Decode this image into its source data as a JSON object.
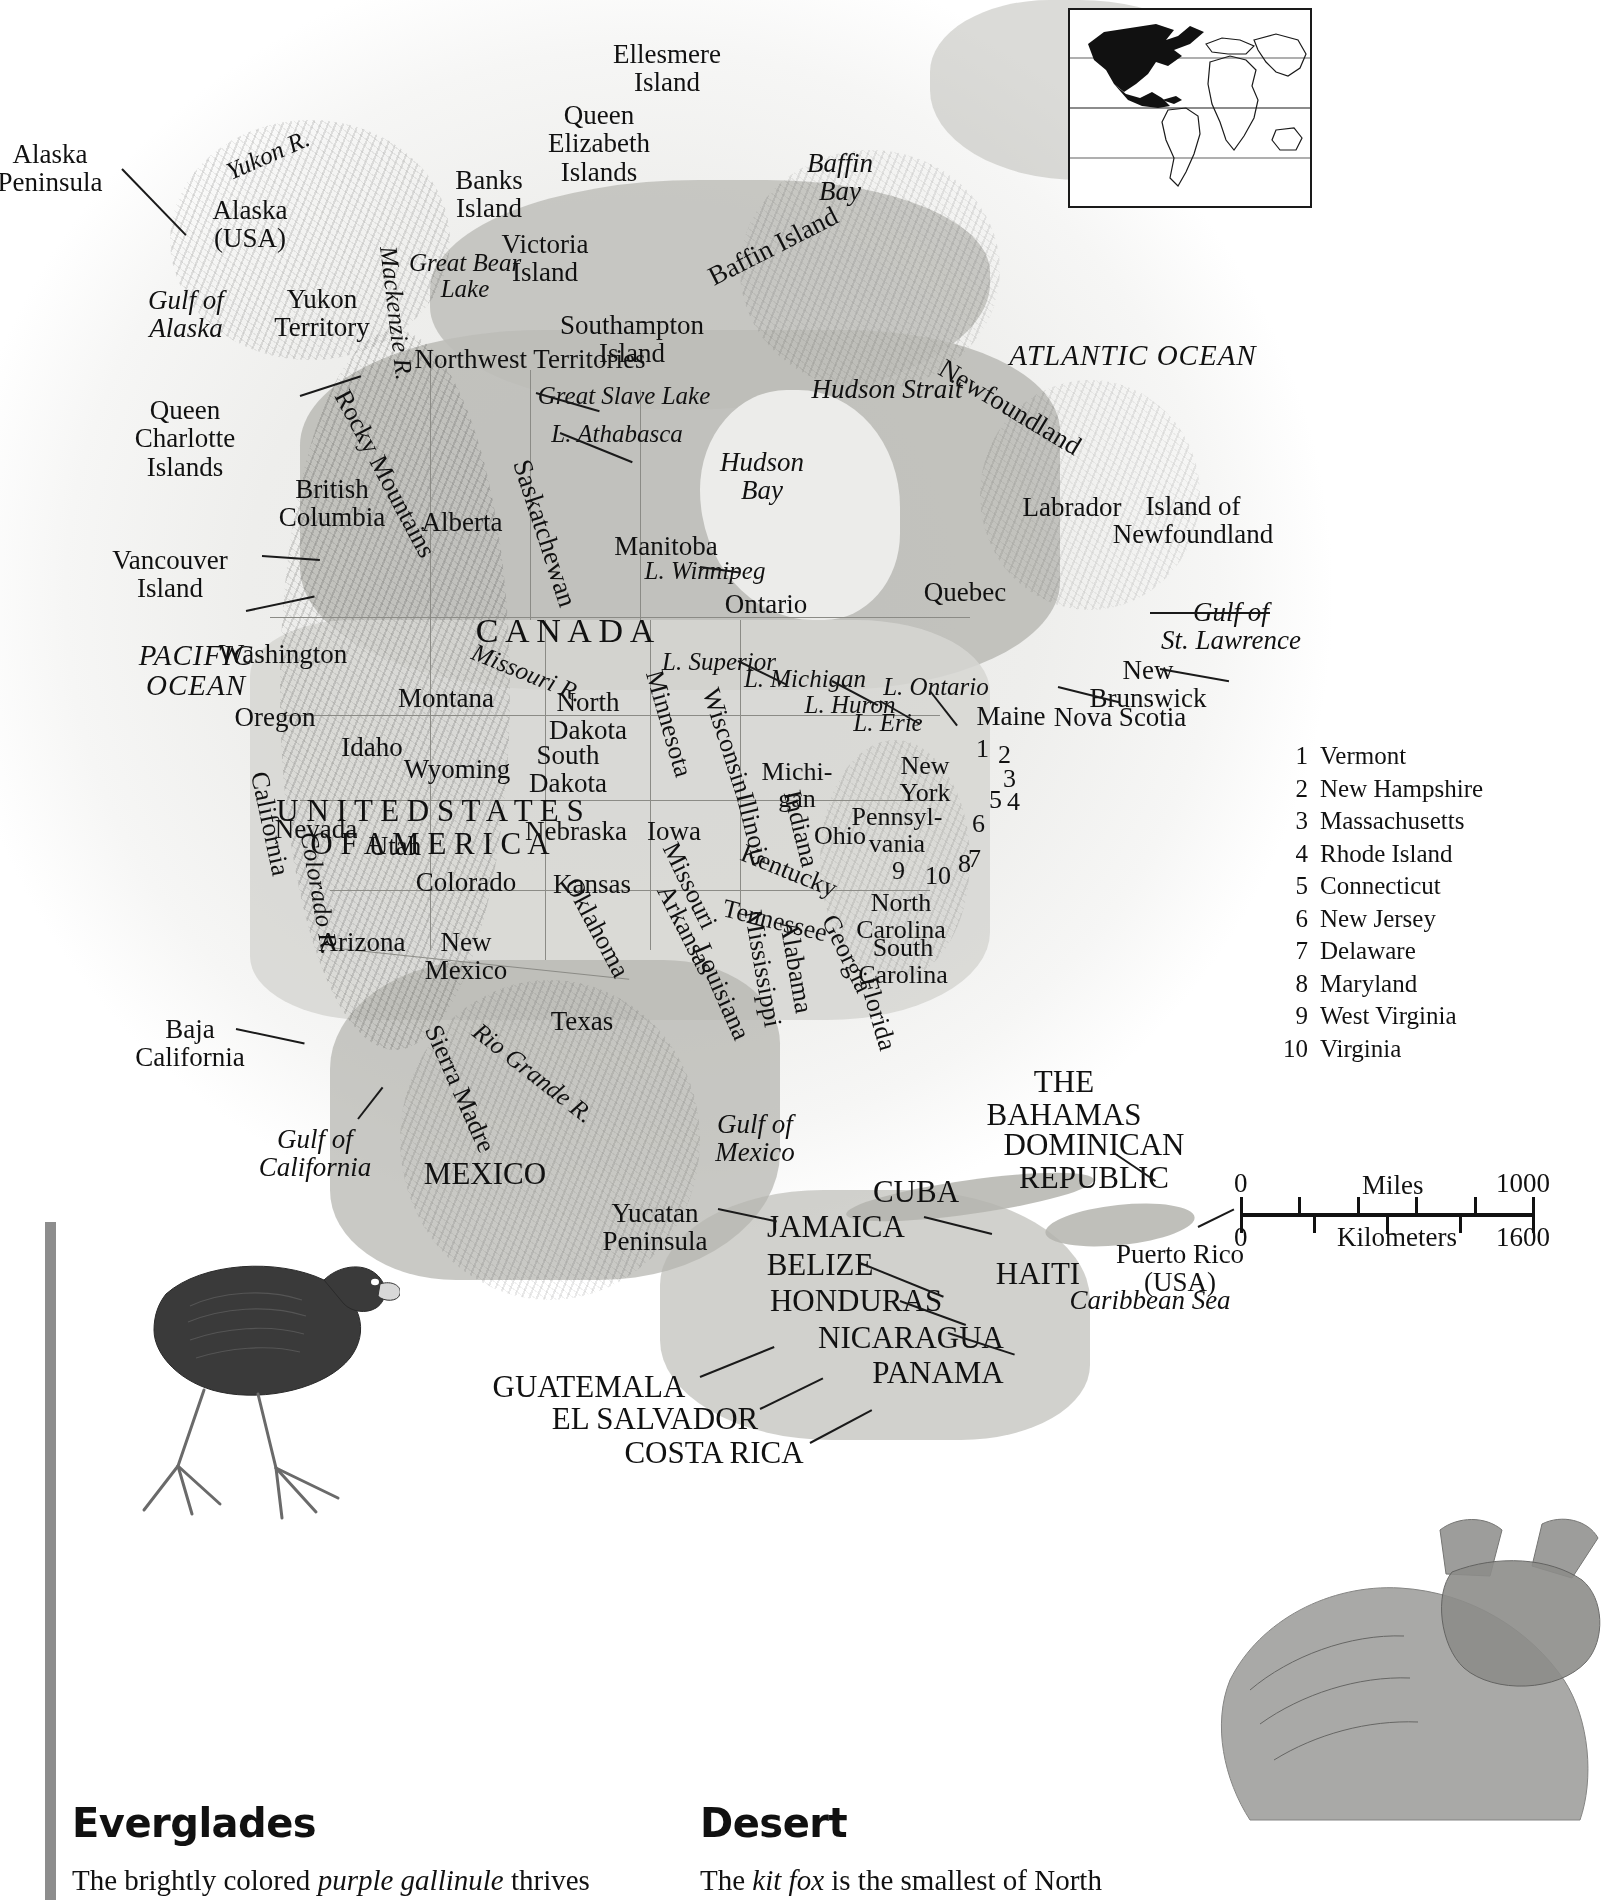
{
  "page": {
    "width": 1620,
    "height": 1900,
    "ink": "#1a1a1a",
    "land_tone": "#c8c8c4",
    "sea_tone": "#e7e7e5"
  },
  "inset": {
    "name": "world-locator-inset",
    "highlight_region": "North America",
    "highlight_color": "#111111",
    "background": "#ffffff"
  },
  "map": {
    "oceans": [
      {
        "text": "PACIFIC\nOCEAN",
        "line1": "PACIFIC",
        "line2": "OCEAN"
      },
      {
        "text": "ATLANTIC OCEAN",
        "line1": "ATLANTIC OCEAN",
        "line2": ""
      }
    ],
    "labels_ocean": [
      {
        "id": "pacific-ocean",
        "line1": "PACIFIC",
        "line2": "OCEAN",
        "x": 196,
        "y": 646,
        "size": 29
      },
      {
        "id": "atlantic-ocean",
        "line1": "ATLANTIC OCEAN",
        "line2": "",
        "x": 1133,
        "y": 343,
        "size": 29
      }
    ],
    "labels_water": [
      {
        "id": "gulf-of-alaska",
        "line1": "Gulf of",
        "line2": "Alaska",
        "x": 186,
        "y": 286,
        "size": 27
      },
      {
        "id": "baffin-bay",
        "line1": "Baffin",
        "line2": "Bay",
        "x": 840,
        "y": 149,
        "size": 27
      },
      {
        "id": "hudson-bay",
        "line1": "Hudson",
        "line2": "Bay",
        "x": 762,
        "y": 448,
        "size": 27
      },
      {
        "id": "hudson-strait",
        "line1": "Hudson Strait",
        "line2": "",
        "x": 887,
        "y": 375,
        "size": 27
      },
      {
        "id": "great-bear-lake",
        "line1": "Great Bear",
        "line2": "Lake",
        "x": 465,
        "y": 250,
        "size": 25
      },
      {
        "id": "great-slave-lake",
        "line1": "Great Slave Lake",
        "line2": "",
        "x": 624,
        "y": 383,
        "size": 25
      },
      {
        "id": "lake-athabasca",
        "line1": "L. Athabasca",
        "line2": "",
        "x": 617,
        "y": 421,
        "size": 25
      },
      {
        "id": "lake-winnipeg",
        "line1": "L. Winnipeg",
        "line2": "",
        "x": 705,
        "y": 558,
        "size": 25
      },
      {
        "id": "lake-superior",
        "line1": "L. Superior",
        "line2": "",
        "x": 719,
        "y": 649,
        "size": 25
      },
      {
        "id": "lake-michigan",
        "line1": "L. Michigan",
        "line2": "",
        "x": 805,
        "y": 666,
        "size": 25
      },
      {
        "id": "lake-huron",
        "line1": "L. Huron",
        "line2": "",
        "x": 850,
        "y": 692,
        "size": 25
      },
      {
        "id": "lake-erie",
        "line1": "L. Erie",
        "line2": "",
        "x": 888,
        "y": 710,
        "size": 25
      },
      {
        "id": "lake-ontario",
        "line1": "L. Ontario",
        "line2": "",
        "x": 936,
        "y": 674,
        "size": 25
      },
      {
        "id": "gulf-of-st-lawrence",
        "line1": "Gulf of",
        "line2": "St. Lawrence",
        "x": 1231,
        "y": 598,
        "size": 27
      },
      {
        "id": "gulf-of-mexico",
        "line1": "Gulf of",
        "line2": "Mexico",
        "x": 755,
        "y": 1110,
        "size": 27
      },
      {
        "id": "gulf-of-california",
        "line1": "Gulf of",
        "line2": "California",
        "x": 315,
        "y": 1125,
        "size": 27
      },
      {
        "id": "caribbean-sea",
        "line1": "Caribbean Sea",
        "line2": "",
        "x": 1150,
        "y": 1286,
        "size": 27
      },
      {
        "id": "yukon-river",
        "line1": "Yukon R.",
        "line2": "",
        "x": 268,
        "y": 142,
        "size": 25,
        "rot": -24
      },
      {
        "id": "mackenzie-river",
        "line1": "Mackenzie R.",
        "line2": "",
        "x": 396,
        "y": 300,
        "size": 25,
        "rot": 83
      },
      {
        "id": "missouri-river",
        "line1": "Missouri R.",
        "line2": "",
        "x": 527,
        "y": 660,
        "size": 25,
        "rot": 22
      },
      {
        "id": "colorado-river",
        "line1": "Colorado R.",
        "line2": "",
        "x": 319,
        "y": 880,
        "size": 25,
        "rot": 80
      },
      {
        "id": "rio-grande-river",
        "line1": "Rio Grande R.",
        "line2": "",
        "x": 533,
        "y": 1060,
        "size": 25,
        "rot": 38
      }
    ],
    "labels_land": [
      {
        "id": "alaska-peninsula",
        "line1": "Alaska",
        "line2": "Peninsula",
        "x": 50,
        "y": 140,
        "size": 27
      },
      {
        "id": "alaska-usa",
        "line1": "Alaska",
        "line2": "(USA)",
        "x": 250,
        "y": 196,
        "size": 27
      },
      {
        "id": "yukon-territory",
        "line1": "Yukon",
        "line2": "Territory",
        "x": 322,
        "y": 285,
        "size": 27
      },
      {
        "id": "northwest-territories",
        "line1": "Northwest Territories",
        "line2": "",
        "x": 530,
        "y": 345,
        "size": 27
      },
      {
        "id": "british-columbia",
        "line1": "British",
        "line2": "Columbia",
        "x": 332,
        "y": 475,
        "size": 27
      },
      {
        "id": "alberta",
        "line1": "Alberta",
        "line2": "",
        "x": 462,
        "y": 508,
        "size": 27
      },
      {
        "id": "saskatchewan",
        "line1": "Saskatchewan",
        "line2": "",
        "x": 545,
        "y": 519,
        "size": 27,
        "rot": 72
      },
      {
        "id": "manitoba",
        "line1": "Manitoba",
        "line2": "",
        "x": 666,
        "y": 532,
        "size": 27
      },
      {
        "id": "ontario",
        "line1": "Ontario",
        "line2": "",
        "x": 766,
        "y": 590,
        "size": 27
      },
      {
        "id": "quebec",
        "line1": "Quebec",
        "line2": "",
        "x": 965,
        "y": 578,
        "size": 27
      },
      {
        "id": "labrador",
        "line1": "Labrador",
        "line2": "",
        "x": 1072,
        "y": 493,
        "size": 27
      },
      {
        "id": "canada",
        "line1": "C A N A D A",
        "line2": "",
        "x": 565,
        "y": 613,
        "size": 34
      },
      {
        "id": "queen-charlotte-islands",
        "line1": "Queen",
        "line2": "Charlotte",
        "line3": "Islands",
        "x": 185,
        "y": 396,
        "size": 27
      },
      {
        "id": "vancouver-island",
        "line1": "Vancouver",
        "line2": "Island",
        "x": 170,
        "y": 546,
        "size": 27
      },
      {
        "id": "banks-island",
        "line1": "Banks",
        "line2": "Island",
        "x": 489,
        "y": 166,
        "size": 27
      },
      {
        "id": "victoria-island",
        "line1": "Victoria",
        "line2": "Island",
        "x": 545,
        "y": 230,
        "size": 27
      },
      {
        "id": "queen-elizabeth-islands",
        "line1": "Queen",
        "line2": "Elizabeth",
        "line3": "Islands",
        "x": 599,
        "y": 101,
        "size": 27
      },
      {
        "id": "ellesmere-island",
        "line1": "Ellesmere",
        "line2": "Island",
        "x": 667,
        "y": 40,
        "size": 27
      },
      {
        "id": "southampton-island",
        "line1": "Southampton",
        "line2": "Island",
        "x": 632,
        "y": 311,
        "size": 27
      },
      {
        "id": "baffin-island",
        "line1": "Baffin Island",
        "line2": "",
        "x": 773,
        "y": 232,
        "size": 27,
        "rot": -27
      },
      {
        "id": "newfoundland-region",
        "line1": "Newfoundland",
        "line2": "",
        "x": 1010,
        "y": 393,
        "size": 27,
        "rot": 31
      },
      {
        "id": "island-of-newfoundland",
        "line1": "Island of",
        "line2": "Newfoundland",
        "x": 1193,
        "y": 492,
        "size": 27
      },
      {
        "id": "new-brunswick",
        "line1": "New",
        "line2": "Brunswick",
        "x": 1148,
        "y": 656,
        "size": 27
      },
      {
        "id": "nova-scotia",
        "line1": "Nova Scotia",
        "line2": "",
        "x": 1120,
        "y": 703,
        "size": 27
      },
      {
        "id": "maine",
        "line1": "Maine",
        "line2": "",
        "x": 1011,
        "y": 702,
        "size": 27
      },
      {
        "id": "washington",
        "line1": "Washington",
        "line2": "",
        "x": 283,
        "y": 640,
        "size": 27
      },
      {
        "id": "oregon",
        "line1": "Oregon",
        "line2": "",
        "x": 275,
        "y": 703,
        "size": 27
      },
      {
        "id": "idaho",
        "line1": "Idaho",
        "line2": "",
        "x": 372,
        "y": 733,
        "size": 27
      },
      {
        "id": "montana",
        "line1": "Montana",
        "line2": "",
        "x": 446,
        "y": 684,
        "size": 27
      },
      {
        "id": "wyoming",
        "line1": "Wyoming",
        "line2": "",
        "x": 457,
        "y": 755,
        "size": 27
      },
      {
        "id": "north-dakota",
        "line1": "North",
        "line2": "Dakota",
        "x": 588,
        "y": 688,
        "size": 27
      },
      {
        "id": "south-dakota",
        "line1": "South",
        "line2": "Dakota",
        "x": 568,
        "y": 741,
        "size": 27
      },
      {
        "id": "nebraska",
        "line1": "Nebraska",
        "line2": "",
        "x": 576,
        "y": 817,
        "size": 27
      },
      {
        "id": "iowa",
        "line1": "Iowa",
        "line2": "",
        "x": 674,
        "y": 817,
        "size": 27
      },
      {
        "id": "minnesota",
        "line1": "Minnesota",
        "line2": "",
        "x": 669,
        "y": 710,
        "size": 26,
        "rot": 74
      },
      {
        "id": "wisconsin",
        "line1": "Wisconsin",
        "line2": "",
        "x": 727,
        "y": 727,
        "size": 26,
        "rot": 72
      },
      {
        "id": "michigan",
        "line1": "Michi-",
        "line2": "gan",
        "x": 797,
        "y": 758,
        "size": 26
      },
      {
        "id": "illinois",
        "line1": "Illinois",
        "line2": "",
        "x": 753,
        "y": 815,
        "size": 26,
        "rot": 76
      },
      {
        "id": "indiana",
        "line1": "Indiana",
        "line2": "",
        "x": 801,
        "y": 815,
        "size": 26,
        "rot": 76
      },
      {
        "id": "ohio",
        "line1": "Ohio",
        "line2": "",
        "x": 840,
        "y": 822,
        "size": 26
      },
      {
        "id": "pennsylvania",
        "line1": "Pennsyl-",
        "line2": "vania",
        "x": 897,
        "y": 803,
        "size": 26
      },
      {
        "id": "new-york",
        "line1": "New",
        "line2": "York",
        "x": 925,
        "y": 752,
        "size": 26
      },
      {
        "id": "nevada",
        "line1": "Nevada",
        "line2": "",
        "x": 316,
        "y": 815,
        "size": 27
      },
      {
        "id": "utah",
        "line1": "Utah",
        "line2": "",
        "x": 395,
        "y": 832,
        "size": 27
      },
      {
        "id": "california",
        "line1": "California",
        "line2": "",
        "x": 270,
        "y": 810,
        "size": 26,
        "rot": 78
      },
      {
        "id": "colorado",
        "line1": "Colorado",
        "line2": "",
        "x": 466,
        "y": 868,
        "size": 27
      },
      {
        "id": "kansas",
        "line1": "Kansas",
        "line2": "",
        "x": 592,
        "y": 870,
        "size": 27
      },
      {
        "id": "missouri",
        "line1": "Missouri",
        "line2": "",
        "x": 690,
        "y": 872,
        "size": 26,
        "rot": 64
      },
      {
        "id": "kentucky",
        "line1": "Kentucky",
        "line2": "",
        "x": 789,
        "y": 857,
        "size": 26,
        "rot": 22
      },
      {
        "id": "tennessee",
        "line1": "Tennessee",
        "line2": "",
        "x": 775,
        "y": 907,
        "size": 26,
        "rot": 14
      },
      {
        "id": "arizona",
        "line1": "Arizona",
        "line2": "",
        "x": 362,
        "y": 928,
        "size": 27
      },
      {
        "id": "new-mexico",
        "line1": "New",
        "line2": "Mexico",
        "x": 466,
        "y": 928,
        "size": 27
      },
      {
        "id": "oklahoma",
        "line1": "Oklahoma",
        "line2": "",
        "x": 597,
        "y": 914,
        "size": 26,
        "rot": 62
      },
      {
        "id": "arkansas",
        "line1": "Arkansas",
        "line2": "",
        "x": 686,
        "y": 916,
        "size": 26,
        "rot": 63
      },
      {
        "id": "louisiana",
        "line1": "Louisiana",
        "line2": "",
        "x": 722,
        "y": 978,
        "size": 26,
        "rot": 66
      },
      {
        "id": "mississippi",
        "line1": "Mississippi",
        "line2": "",
        "x": 763,
        "y": 955,
        "size": 26,
        "rot": 80
      },
      {
        "id": "alabama",
        "line1": "Alabama",
        "line2": "",
        "x": 796,
        "y": 953,
        "size": 26,
        "rot": 80
      },
      {
        "id": "georgia",
        "line1": "Georgia",
        "line2": "",
        "x": 847,
        "y": 940,
        "size": 26,
        "rot": 64
      },
      {
        "id": "florida",
        "line1": "Florida",
        "line2": "",
        "x": 878,
        "y": 1000,
        "size": 26,
        "rot": 74
      },
      {
        "id": "north-carolina",
        "line1": "North",
        "line2": "Carolina",
        "x": 901,
        "y": 889,
        "size": 26
      },
      {
        "id": "south-carolina",
        "line1": "South",
        "line2": "Carolina",
        "x": 903,
        "y": 934,
        "size": 26
      },
      {
        "id": "texas",
        "line1": "Texas",
        "line2": "",
        "x": 582,
        "y": 1007,
        "size": 27
      },
      {
        "id": "united-states-of-america",
        "line1": "U N I T E D   S T A T E S",
        "line2": "O F   A M E R I C A",
        "x": 430,
        "y": 795,
        "size": 31
      },
      {
        "id": "rocky-mountains",
        "line1": "Rocky Mountains",
        "line2": "",
        "x": 385,
        "y": 460,
        "size": 26,
        "rot": 62
      },
      {
        "id": "sierra-madre",
        "line1": "Sierra Madre",
        "line2": "",
        "x": 460,
        "y": 1075,
        "size": 26,
        "rot": 66
      },
      {
        "id": "baja-california",
        "line1": "Baja",
        "line2": "California",
        "x": 190,
        "y": 1015,
        "size": 27
      },
      {
        "id": "mexico",
        "line1": "MEXICO",
        "line2": "",
        "x": 485,
        "y": 1158,
        "size": 31
      },
      {
        "id": "yucatan-peninsula",
        "line1": "Yucatan",
        "line2": "Peninsula",
        "x": 655,
        "y": 1199,
        "size": 27
      },
      {
        "id": "the-bahamas",
        "line1": "THE",
        "line2": "BAHAMAS",
        "x": 1064,
        "y": 1066,
        "size": 31
      },
      {
        "id": "cuba",
        "line1": "CUBA",
        "line2": "",
        "x": 916,
        "y": 1176,
        "size": 31
      },
      {
        "id": "jamaica",
        "line1": "JAMAICA",
        "line2": "",
        "x": 836,
        "y": 1211,
        "size": 31
      },
      {
        "id": "haiti",
        "line1": "HAITI",
        "line2": "",
        "x": 1038,
        "y": 1258,
        "size": 31
      },
      {
        "id": "dominican-republic",
        "line1": "DOMINICAN",
        "line2": "REPUBLIC",
        "x": 1094,
        "y": 1129,
        "size": 31
      },
      {
        "id": "puerto-rico",
        "line1": "Puerto Rico",
        "line2": "(USA)",
        "x": 1180,
        "y": 1240,
        "size": 27
      },
      {
        "id": "belize",
        "line1": "BELIZE",
        "line2": "",
        "x": 820,
        "y": 1249,
        "size": 31
      },
      {
        "id": "honduras",
        "line1": "HONDURAS",
        "line2": "",
        "x": 856,
        "y": 1285,
        "size": 31
      },
      {
        "id": "nicaragua",
        "line1": "NICARAGUA",
        "line2": "",
        "x": 911,
        "y": 1322,
        "size": 31
      },
      {
        "id": "panama",
        "line1": "PANAMA",
        "line2": "",
        "x": 938,
        "y": 1357,
        "size": 31
      },
      {
        "id": "guatemala",
        "line1": "GUATEMALA",
        "line2": "",
        "x": 589,
        "y": 1371,
        "size": 31
      },
      {
        "id": "el-salvador",
        "line1": "EL SALVADOR",
        "line2": "",
        "x": 655,
        "y": 1403,
        "size": 31
      },
      {
        "id": "costa-rica",
        "line1": "COSTA RICA",
        "line2": "",
        "x": 714,
        "y": 1437,
        "size": 31
      }
    ]
  },
  "legend": {
    "name": "numbered-state-legend",
    "items": [
      {
        "num": "1",
        "label": "Vermont"
      },
      {
        "num": "2",
        "label": "New Hampshire"
      },
      {
        "num": "3",
        "label": "Massachusetts"
      },
      {
        "num": "4",
        "label": "Rhode Island"
      },
      {
        "num": "5",
        "label": "Connecticut"
      },
      {
        "num": "6",
        "label": "New Jersey"
      },
      {
        "num": "7",
        "label": "Delaware"
      },
      {
        "num": "8",
        "label": "Maryland"
      },
      {
        "num": "9",
        "label": "West Virginia"
      },
      {
        "num": "10",
        "label": "Virginia"
      }
    ],
    "map_numbers": [
      {
        "num": "1",
        "x": 976,
        "y": 735
      },
      {
        "num": "2",
        "x": 998,
        "y": 741
      },
      {
        "num": "3",
        "x": 1003,
        "y": 765
      },
      {
        "num": "4",
        "x": 1007,
        "y": 788
      },
      {
        "num": "5",
        "x": 989,
        "y": 786
      },
      {
        "num": "6",
        "x": 972,
        "y": 810
      },
      {
        "num": "7",
        "x": 968,
        "y": 845
      },
      {
        "num": "8",
        "x": 958,
        "y": 850
      },
      {
        "num": "9",
        "x": 892,
        "y": 857
      },
      {
        "num": "10",
        "x": 925,
        "y": 862
      }
    ]
  },
  "scale": {
    "name": "map-scale-bar",
    "miles_label": "Miles",
    "kilometers_label": "Kilometers",
    "miles_min": "0",
    "miles_max": "1000",
    "km_min": "0",
    "km_max": "1600",
    "miles_ticks": 5,
    "km_ticks": 4
  },
  "captions": [
    {
      "id": "everglades",
      "heading": "Everglades",
      "body_pre": "The brightly colored ",
      "body_italic": "purple gallinule",
      "body_post": " thrives",
      "art": "purple-gallinule-bird-illustration"
    },
    {
      "id": "desert",
      "heading": "Desert",
      "body_pre": "The ",
      "body_italic": "kit fox",
      "body_post": " is the smallest of North",
      "art": "kit-fox-illustration"
    }
  ]
}
